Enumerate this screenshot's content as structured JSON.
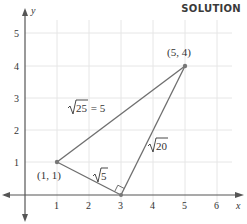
{
  "header": {
    "label": "SOLUTION"
  },
  "axes": {
    "x_label": "x",
    "y_label": "y",
    "x_ticks": [
      "1",
      "2",
      "3",
      "4",
      "5",
      "6"
    ],
    "y_ticks": [
      "1",
      "2",
      "3",
      "4",
      "5"
    ]
  },
  "points": [
    {
      "label": "(1, 1)",
      "x": 1,
      "y": 1
    },
    {
      "label": "(3, 0)",
      "x": 3,
      "y": 0,
      "shown_label": false
    },
    {
      "label": "(5, 4)",
      "x": 5,
      "y": 4
    }
  ],
  "segments": [
    {
      "from": "(1, 1)",
      "to": "(5, 4)",
      "label_radicand": "25",
      "label_suffix": " = 5"
    },
    {
      "from": "(1, 1)",
      "to": "(3, 0)",
      "label_radicand": "5",
      "label_suffix": ""
    },
    {
      "from": "(3, 0)",
      "to": "(5, 4)",
      "label_radicand": "20",
      "label_suffix": ""
    }
  ],
  "right_angle_at": "(3, 0)",
  "colors": {
    "line": "#6e6e6e",
    "grid": "#e6e6e6",
    "axis": "#555555",
    "point": "#777777"
  }
}
